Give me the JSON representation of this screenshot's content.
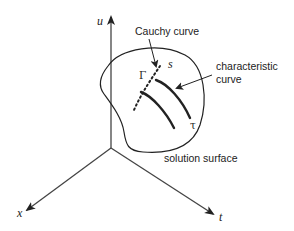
{
  "diagram": {
    "axes": {
      "u": {
        "label": "u"
      },
      "x": {
        "label": "x"
      },
      "t": {
        "label": "t"
      }
    },
    "labels": {
      "cauchy_curve": "Cauchy curve",
      "characteristic_line1": "characteristic",
      "characteristic_line2": "curve",
      "solution_surface": "solution surface",
      "gamma": "Γ",
      "s": "s",
      "tau": "τ"
    },
    "colors": {
      "stroke": "#222222",
      "background": "#ffffff"
    }
  }
}
